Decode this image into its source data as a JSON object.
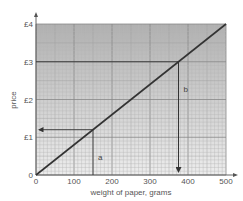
{
  "chart_data": {
    "type": "line",
    "title": "",
    "xlabel": "weight of paper, grams",
    "ylabel": "price",
    "xlim": [
      0,
      500
    ],
    "ylim": [
      0,
      4
    ],
    "x_ticks": [
      0,
      100,
      200,
      300,
      400,
      500
    ],
    "x_tick_labels": [
      "0",
      "100",
      "200",
      "300",
      "400",
      "500"
    ],
    "y_ticks": [
      0,
      1,
      2,
      3,
      4
    ],
    "y_tick_labels": [
      "0",
      "£1",
      "£2",
      "£3",
      "£4"
    ],
    "grid": true,
    "series": [
      {
        "name": "price line",
        "x": [
          0,
          500
        ],
        "y": [
          0,
          4
        ]
      }
    ],
    "annotations": [
      {
        "label": "a",
        "x": 150,
        "y": 1.2,
        "description": "vertical line from 150 g up to line, arrow left to price axis at £1.20"
      },
      {
        "label": "b",
        "x": 375,
        "y": 3,
        "description": "horizontal line from £3 to line, arrow down to weight axis at 375 g"
      }
    ],
    "colors": {
      "line": "#333333",
      "grid_major": "#888888",
      "grid_minor": "#b5b5b5",
      "bg_top": "#b8b8b8",
      "bg_bottom": "#ececec"
    }
  }
}
